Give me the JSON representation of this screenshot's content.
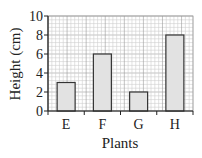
{
  "chart_data": {
    "type": "bar",
    "title": "",
    "xlabel": "Plants",
    "ylabel": "Height (cm)",
    "categories": [
      "E",
      "F",
      "G",
      "H"
    ],
    "values": [
      3,
      6,
      2,
      8
    ],
    "ylim": [
      0,
      10
    ],
    "yticks": [
      "0",
      "2",
      "4",
      "6",
      "8",
      "10"
    ],
    "grid": true,
    "legend": null,
    "colors": {
      "bar_fill": "#e2e2e2",
      "bar_stroke": "#333333",
      "grid_major": "#9a9a9a",
      "grid_minor": "#cfcfcf"
    }
  }
}
